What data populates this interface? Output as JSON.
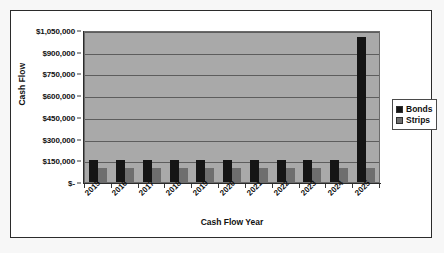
{
  "chart_data": {
    "type": "bar",
    "title": "",
    "xlabel": "Cash Flow Year",
    "ylabel": "Cash Flow",
    "categories": [
      "2015",
      "2016",
      "2017",
      "2018",
      "2019",
      "2020",
      "2021",
      "2022",
      "2023",
      "2024",
      "2025"
    ],
    "series": [
      {
        "name": "Bonds",
        "color": "#151515",
        "values": [
          150000,
          150000,
          150000,
          150000,
          150000,
          150000,
          150000,
          150000,
          150000,
          150000,
          1000000
        ]
      },
      {
        "name": "Strips",
        "color": "#6e6e6e",
        "values": [
          100000,
          100000,
          100000,
          100000,
          100000,
          100000,
          100000,
          100000,
          100000,
          100000,
          100000
        ]
      }
    ],
    "ylim": [
      0,
      1050000
    ],
    "ytick_values": [
      1050000,
      900000,
      750000,
      600000,
      450000,
      300000,
      150000,
      0
    ],
    "ytick_labels": [
      "$1,050,000",
      "$900,000",
      "$750,000",
      "$600,000",
      "$450,000",
      "$300,000",
      "$150,000",
      "$-"
    ],
    "grid": true,
    "legend_position": "right",
    "plot_background": "#a9a9a9"
  },
  "legend": {
    "items": [
      {
        "label": "Bonds"
      },
      {
        "label": "Strips"
      }
    ]
  }
}
